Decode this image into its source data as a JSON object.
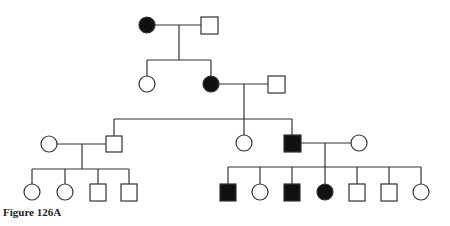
{
  "figure": {
    "caption": "Figure 126A",
    "type": "pedigree",
    "legend_notes": {
      "square": "male",
      "circle": "female",
      "filled": "affected",
      "open": "unaffected"
    }
  },
  "colors": {
    "line": "#333333",
    "affected_fill": "#111111",
    "unaffected_fill": "#ffffff"
  },
  "generations": [
    {
      "id": "I",
      "individuals": [
        {
          "id": "I-1",
          "sex": "female",
          "affected": true
        },
        {
          "id": "I-2",
          "sex": "male",
          "affected": false
        }
      ]
    },
    {
      "id": "II",
      "individuals": [
        {
          "id": "II-1",
          "sex": "female",
          "affected": false
        },
        {
          "id": "II-2",
          "sex": "female",
          "affected": true
        },
        {
          "id": "II-3",
          "sex": "male",
          "affected": false,
          "spouse_of": "II-2"
        }
      ]
    },
    {
      "id": "III",
      "individuals": [
        {
          "id": "III-1",
          "sex": "female",
          "affected": false,
          "spouse_of": "III-2"
        },
        {
          "id": "III-2",
          "sex": "male",
          "affected": false
        },
        {
          "id": "III-3",
          "sex": "female",
          "affected": false
        },
        {
          "id": "III-4",
          "sex": "male",
          "affected": true
        },
        {
          "id": "III-5",
          "sex": "female",
          "affected": false,
          "spouse_of": "III-4"
        }
      ]
    },
    {
      "id": "IV",
      "individuals": [
        {
          "id": "IV-1",
          "sex": "female",
          "affected": false
        },
        {
          "id": "IV-2",
          "sex": "female",
          "affected": false
        },
        {
          "id": "IV-3",
          "sex": "male",
          "affected": false
        },
        {
          "id": "IV-4",
          "sex": "male",
          "affected": false
        },
        {
          "id": "IV-5",
          "sex": "male",
          "affected": true
        },
        {
          "id": "IV-6",
          "sex": "female",
          "affected": false
        },
        {
          "id": "IV-7",
          "sex": "male",
          "affected": true
        },
        {
          "id": "IV-8",
          "sex": "female",
          "affected": true
        },
        {
          "id": "IV-9",
          "sex": "male",
          "affected": false
        },
        {
          "id": "IV-10",
          "sex": "male",
          "affected": false
        },
        {
          "id": "IV-11",
          "sex": "female",
          "affected": false
        }
      ]
    }
  ]
}
